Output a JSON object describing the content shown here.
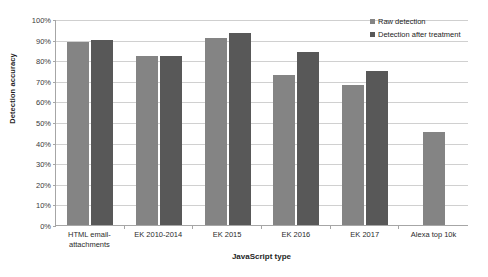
{
  "chart_data": {
    "type": "bar",
    "title": "",
    "xlabel": "JavaScript type",
    "ylabel": "Detection accuracy",
    "categories": [
      "HTML email-attachments",
      "EK 2010-2014",
      "EK 2015",
      "EK 2016",
      "EK 2017",
      "Alexa top 10k"
    ],
    "series": [
      {
        "name": "Raw detection",
        "color": "#848484",
        "values": [
          89,
          82,
          91,
          73,
          68,
          45
        ]
      },
      {
        "name": "Detection after treatment",
        "color": "#585858",
        "values": [
          90,
          82,
          93,
          84,
          75,
          null
        ]
      }
    ],
    "ylim": [
      0,
      100
    ],
    "ytick_labels": [
      "0%",
      "10%",
      "20%",
      "30%",
      "40%",
      "50%",
      "60%",
      "70%",
      "80%",
      "90%",
      "100%"
    ],
    "ytick_values": [
      0,
      10,
      20,
      30,
      40,
      50,
      60,
      70,
      80,
      90,
      100
    ],
    "grid": true,
    "legend_position": "top-right"
  },
  "axis": {
    "y_title": "Detection accuracy",
    "x_title": "JavaScript type"
  },
  "x_labels": [
    {
      "line1": "HTML email-",
      "line2": "attachments"
    },
    {
      "line1": "EK 2010-2014",
      "line2": ""
    },
    {
      "line1": "EK 2015",
      "line2": ""
    },
    {
      "line1": "EK 2016",
      "line2": ""
    },
    {
      "line1": "EK 2017",
      "line2": ""
    },
    {
      "line1": "Alexa top 10k",
      "line2": ""
    }
  ],
  "legend": {
    "items": [
      {
        "label": "Raw detection",
        "color": "#848484"
      },
      {
        "label": "Detection after treatment",
        "color": "#585858"
      }
    ]
  }
}
